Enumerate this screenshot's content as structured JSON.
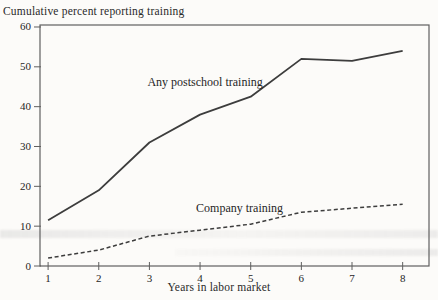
{
  "chart_data": {
    "type": "line",
    "title": "Cumulative percent reporting training",
    "xlabel": "Years in labor market",
    "ylabel": "",
    "x": [
      1,
      2,
      3,
      4,
      5,
      6,
      7,
      8
    ],
    "xticks": [
      "1",
      "2",
      "3",
      "4",
      "5",
      "6",
      "7",
      "8"
    ],
    "yticks": [
      0,
      10,
      20,
      30,
      40,
      50,
      60
    ],
    "xlim": [
      0.84,
      8.52
    ],
    "ylim": [
      0,
      60.5
    ],
    "grid": false,
    "frame": true,
    "legend": "inline-labels",
    "series": [
      {
        "name": "Any postschool training",
        "style": "solid",
        "values": [
          11.5,
          19,
          31,
          38,
          42.5,
          52,
          51.5,
          54
        ],
        "label_pos": {
          "x": 4.1,
          "y": 45.2
        }
      },
      {
        "name": "Company training",
        "style": "dashed",
        "values": [
          2,
          4,
          7.5,
          9,
          10.5,
          13.5,
          14.5,
          15.5
        ],
        "label_pos": {
          "x": 4.78,
          "y": 13.6
        }
      }
    ],
    "colors": {
      "line": "#3d3d3d",
      "frame": "#5f5f5f",
      "text": "#262626",
      "background": "#fcfbf9"
    }
  }
}
